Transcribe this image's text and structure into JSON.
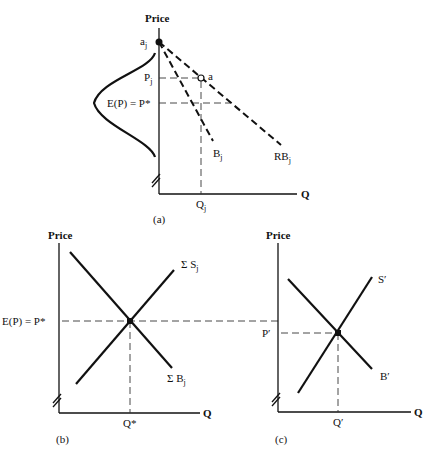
{
  "panels": {
    "a": {
      "caption": "(a)",
      "y_axis_label": "Price",
      "x_axis_label": "Q",
      "point_aj": "a",
      "point_aj_sub": "j",
      "point_a": "a",
      "pj_label": "P",
      "pj_sub": "j",
      "ep_label": "E(P) = P*",
      "qj_label": "Q",
      "qj_sub": "j",
      "bj_label": "B",
      "bj_sub": "j",
      "rbj_label": "RB",
      "rbj_sub": "j"
    },
    "b": {
      "caption": "(b)",
      "y_axis_label": "Price",
      "x_axis_label": "Q",
      "ep_label": "E(P) = P*",
      "supply_label": "Σ S",
      "supply_sub": "j",
      "demand_label": "Σ B",
      "demand_sub": "j",
      "q_label": "Q*"
    },
    "c": {
      "caption": "(c)",
      "y_axis_label": "Price",
      "x_axis_label": "Q",
      "p_label": "P′",
      "supply_label": "S′",
      "demand_label": "B′",
      "q_label": "Q′"
    }
  }
}
